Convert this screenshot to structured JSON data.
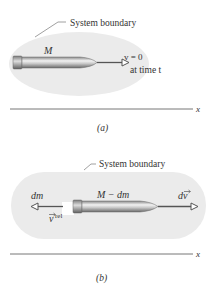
{
  "panel_a": {
    "boundary_label": "System boundary",
    "mass_label": "M",
    "velocity_label": "v = 0",
    "time_label": "at time t",
    "axis_label": "x",
    "caption": "(a)"
  },
  "panel_b": {
    "boundary_label": "System boundary",
    "mass_label": "M − dm",
    "exhaust_mass_label": "dm",
    "exhaust_velocity_label": "v",
    "exhaust_velocity_sup": "rel",
    "velocity_change_label": "dv",
    "axis_label": "x",
    "caption": "(b)"
  },
  "colors": {
    "boundary_fill": "#ebebeb",
    "rocket_dark": "#6e6e6e",
    "rocket_light": "#e6e6e6",
    "arrow": "#555555",
    "axis": "#777777",
    "text": "#333333"
  }
}
